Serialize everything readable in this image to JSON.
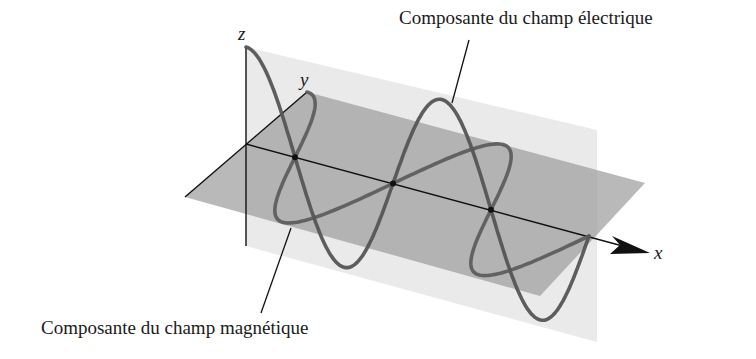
{
  "figure": {
    "labels": {
      "electric": "Composante du champ électrique",
      "magnetic": "Composante du champ magnétique"
    },
    "axes": {
      "x": "x",
      "y": "y",
      "z": "z"
    },
    "colors": {
      "background": "#ffffff",
      "vertical_plane": "#e6e6e6",
      "horizontal_plane": "#a8a8a8",
      "wave": "#5a5a5a",
      "axis": "#111111"
    },
    "geometry": {
      "origin": [
        246,
        144
      ],
      "x_axis_end": [
        648,
        253
      ],
      "half_wavelength_px": [
        98,
        26.3
      ],
      "electric_amplitude_px": 97,
      "magnetic_amplitude_px": [
        61,
        -52
      ],
      "half_waves": 7
    }
  }
}
